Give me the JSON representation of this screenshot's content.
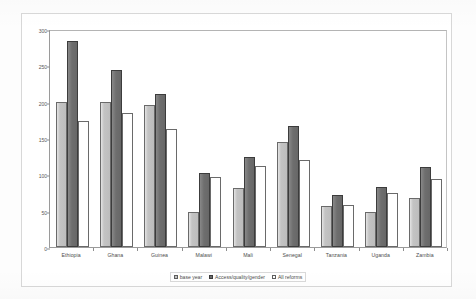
{
  "figure": {
    "y_axis_title": "unit costs ($PPP)",
    "y_ticks": [
      "0",
      "50",
      "100",
      "150",
      "200",
      "250",
      "300"
    ]
  },
  "legend": {
    "items": [
      {
        "label": "base year",
        "key": "base_year",
        "color": "#c3c3c3"
      },
      {
        "label": "Access/quality/gender",
        "key": "access_quality_gender",
        "color": "#6e6e6e"
      },
      {
        "label": "All reforms",
        "key": "all_reforms",
        "color": "#ffffff"
      }
    ]
  },
  "chart_data": {
    "type": "bar",
    "title": "",
    "xlabel": "",
    "ylabel": "unit costs ($PPP)",
    "ylim": [
      0,
      300
    ],
    "ytick_step": 50,
    "grid": false,
    "legend_position": "bottom",
    "categories": [
      "Ethiopia",
      "Ghana",
      "Guinea",
      "Malawi",
      "Mali",
      "Senegal",
      "Tanzania",
      "Uganda",
      "Zambia"
    ],
    "series": [
      {
        "name": "base year",
        "color": "#c3c3c3",
        "values": [
          200,
          199,
          196,
          48,
          81,
          144,
          57,
          48,
          67
        ]
      },
      {
        "name": "Access/quality/gender",
        "color": "#6e6e6e",
        "values": [
          283,
          244,
          211,
          102,
          124,
          166,
          71,
          83,
          110
        ]
      },
      {
        "name": "All reforms",
        "color": "#ffffff",
        "values": [
          173,
          185,
          162,
          96,
          112,
          120,
          58,
          75,
          93
        ]
      }
    ]
  }
}
